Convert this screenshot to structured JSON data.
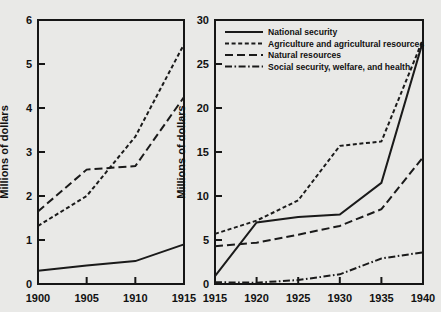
{
  "chart_data": [
    {
      "id": "panel-left",
      "type": "line",
      "title": "",
      "xlabel": "",
      "ylabel": "Millions of dollars",
      "x": [
        1900,
        1905,
        1910,
        1915
      ],
      "xticks": [
        "1900",
        "1905",
        "1910",
        "1915"
      ],
      "xlim": [
        1900,
        1915
      ],
      "ylim": [
        0,
        6
      ],
      "yticks": [
        "0",
        "1",
        "2",
        "3",
        "4",
        "5",
        "6"
      ],
      "ytickvals": [
        0,
        1,
        2,
        3,
        4,
        5,
        6
      ],
      "grid": false,
      "legend": "none",
      "series": [
        {
          "name": "National security",
          "dash": "solid",
          "values": [
            0.3,
            0.42,
            0.52,
            0.9
          ]
        },
        {
          "name": "Agriculture and agricultural resources",
          "dash": "short-dash",
          "values": [
            1.32,
            2.0,
            3.35,
            5.45
          ]
        },
        {
          "name": "Natural resources",
          "dash": "long-dash",
          "values": [
            1.65,
            2.6,
            2.68,
            4.25
          ]
        }
      ]
    },
    {
      "id": "panel-right",
      "type": "line",
      "title": "",
      "xlabel": "",
      "ylabel": "Millions of dollars",
      "x": [
        1915,
        1920,
        1925,
        1930,
        1935,
        1940
      ],
      "xticks": [
        "1915",
        "1920",
        "1925",
        "1930",
        "1935",
        "1940"
      ],
      "xlim": [
        1915,
        1940
      ],
      "ylim": [
        0,
        30
      ],
      "yticks": [
        "0",
        "5",
        "10",
        "15",
        "20",
        "25",
        "30"
      ],
      "ytickvals": [
        0,
        5,
        10,
        15,
        20,
        25,
        30
      ],
      "grid": false,
      "legend": "top-left-inside",
      "series": [
        {
          "name": "National security",
          "dash": "solid",
          "values": [
            0.9,
            7.0,
            7.6,
            7.9,
            11.5,
            27.6
          ]
        },
        {
          "name": "Agriculture and agricultural resources",
          "dash": "short-dash",
          "values": [
            5.7,
            7.2,
            9.5,
            15.7,
            16.2,
            27.8
          ]
        },
        {
          "name": "Natural resources",
          "dash": "long-dash",
          "values": [
            4.3,
            4.7,
            5.6,
            6.6,
            8.5,
            14.4
          ]
        },
        {
          "name": "Social security, welfare, and health",
          "dash": "dash-dot",
          "values": [
            0.2,
            0.15,
            0.45,
            1.1,
            2.9,
            3.6
          ]
        }
      ]
    }
  ],
  "legend": {
    "entries": [
      {
        "label": "National security",
        "dash": "solid"
      },
      {
        "label": "Agriculture and agricultural resources",
        "dash": "short-dash"
      },
      {
        "label": "Natural resources",
        "dash": "long-dash"
      },
      {
        "label": "Social security, welfare, and health",
        "dash": "dash-dot"
      }
    ]
  }
}
